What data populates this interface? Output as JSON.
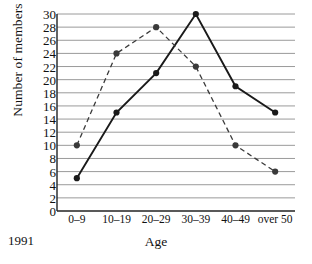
{
  "chart_data": {
    "type": "line",
    "title": "",
    "xlabel": "Age",
    "ylabel": "Number of members",
    "categories": [
      "0–9",
      "10–19",
      "20–29",
      "30–39",
      "40–49",
      "over 50"
    ],
    "ylim": [
      0,
      30
    ],
    "ytick_step": 2,
    "yticks": [
      "0",
      "2",
      "4",
      "6",
      "8",
      "10",
      "12",
      "14",
      "16",
      "18",
      "20",
      "22",
      "24",
      "26",
      "28",
      "30"
    ],
    "grid": "horizontal",
    "legend_position": "none",
    "annotations": [
      {
        "name": "year-label",
        "text": "1991",
        "position": "bottom-left"
      }
    ],
    "series": [
      {
        "name": "solid-series",
        "style": "solid",
        "color": "#1a1a1a",
        "marker": "filled-circle",
        "values": [
          5,
          15,
          21,
          30,
          19,
          15
        ]
      },
      {
        "name": "dashed-series",
        "style": "dashed",
        "color": "#3a3a3a",
        "marker": "filled-circle",
        "values": [
          10,
          24,
          28,
          22,
          10,
          6
        ]
      }
    ]
  },
  "colors": {
    "gridline": "#9a9a9a",
    "axis": "#222222",
    "background": "#ffffff"
  }
}
